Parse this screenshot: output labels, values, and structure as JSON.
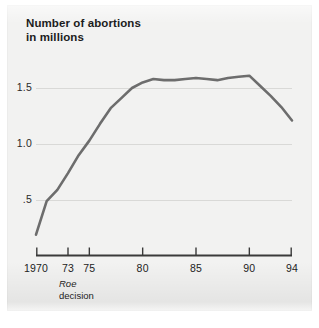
{
  "chart_data": {
    "type": "line",
    "title": "Number of abortions\nin millions",
    "xlabel": "",
    "ylabel": "",
    "xlim": [
      1970,
      1994
    ],
    "ylim": [
      0,
      1.75
    ],
    "grid": true,
    "legend": null,
    "line_color": "#6d6d6d",
    "background_color": "#f2f2f1",
    "gridline_color": "#d9d9d7",
    "axis_color": "#3a3a3a",
    "y_ticks": [
      {
        "value": 0.5,
        "label": ".5"
      },
      {
        "value": 1.0,
        "label": "1.0"
      },
      {
        "value": 1.5,
        "label": "1.5"
      }
    ],
    "x_ticks": [
      {
        "value": 1970,
        "label": "1970"
      },
      {
        "value": 1973,
        "label": "73"
      },
      {
        "value": 1975,
        "label": "75"
      },
      {
        "value": 1980,
        "label": "80"
      },
      {
        "value": 1985,
        "label": "85"
      },
      {
        "value": 1990,
        "label": "90"
      },
      {
        "value": 1994,
        "label": "94"
      }
    ],
    "annotations": [
      {
        "x": 1973,
        "line1": "Roe",
        "line2": "decision"
      }
    ],
    "x": [
      1970,
      1971,
      1972,
      1973,
      1974,
      1975,
      1976,
      1977,
      1978,
      1979,
      1980,
      1981,
      1982,
      1983,
      1984,
      1985,
      1986,
      1987,
      1988,
      1989,
      1990,
      1991,
      1992,
      1993,
      1994
    ],
    "values": [
      0.19,
      0.49,
      0.59,
      0.74,
      0.9,
      1.03,
      1.18,
      1.32,
      1.41,
      1.5,
      1.55,
      1.58,
      1.57,
      1.57,
      1.58,
      1.59,
      1.58,
      1.57,
      1.59,
      1.6,
      1.61,
      1.52,
      1.43,
      1.33,
      1.21
    ],
    "series": [
      {
        "name": "Number of abortions (millions)",
        "values": [
          0.19,
          0.49,
          0.59,
          0.74,
          0.9,
          1.03,
          1.18,
          1.32,
          1.41,
          1.5,
          1.55,
          1.58,
          1.57,
          1.57,
          1.58,
          1.59,
          1.58,
          1.57,
          1.59,
          1.6,
          1.61,
          1.52,
          1.43,
          1.33,
          1.21
        ]
      }
    ]
  }
}
